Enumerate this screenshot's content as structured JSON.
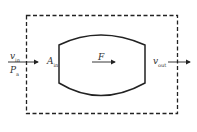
{
  "labels": {
    "v_in": "v",
    "v_in_sub": "in",
    "p_a": "P",
    "p_a_sub": "a",
    "a_in": "A",
    "a_in_sub": "in",
    "force": "F",
    "v_out": "v",
    "v_out_sub": "out"
  },
  "colors": {
    "stroke": "#222222",
    "background": "#ffffff"
  }
}
